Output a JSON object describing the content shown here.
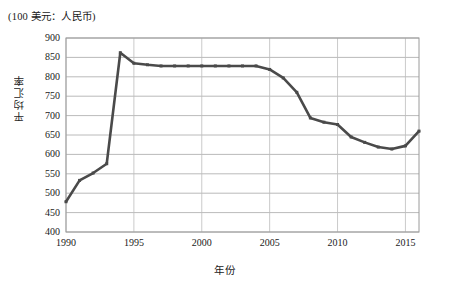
{
  "figure": {
    "unit_note": "(100 美元：人民币)",
    "xlabel": "年份",
    "ylabel": "平均汇率"
  },
  "axis": {
    "y_ticks": [
      "900",
      "850",
      "800",
      "750",
      "700",
      "650",
      "600",
      "550",
      "500",
      "450",
      "400"
    ],
    "x_ticks": [
      "1990",
      "1995",
      "2000",
      "2005",
      "2010",
      "2015"
    ]
  },
  "chart_data": {
    "type": "line",
    "title": "(100 美元：人民币)",
    "xlabel": "年份",
    "ylabel": "平均汇率",
    "xlim": [
      1990,
      2016
    ],
    "ylim": [
      400,
      900
    ],
    "ytick_step": 50,
    "xtick_step": 5,
    "grid": true,
    "legend": "none",
    "line_color": "#4a4a4a",
    "x": [
      1990,
      1991,
      1992,
      1993,
      1994,
      1995,
      1996,
      1997,
      1998,
      1999,
      2000,
      2001,
      2002,
      2003,
      2004,
      2005,
      2006,
      2007,
      2008,
      2009,
      2010,
      2011,
      2012,
      2013,
      2014,
      2015,
      2016
    ],
    "values": [
      478,
      533,
      552,
      576,
      862,
      835,
      831,
      828,
      828,
      828,
      828,
      828,
      828,
      828,
      828,
      819,
      797,
      760,
      694,
      683,
      677,
      645,
      631,
      619,
      614,
      622,
      660
    ],
    "series": [
      {
        "name": "平均汇率",
        "values": [
          478,
          533,
          552,
          576,
          862,
          835,
          831,
          828,
          828,
          828,
          828,
          828,
          828,
          828,
          828,
          819,
          797,
          760,
          694,
          683,
          677,
          645,
          631,
          619,
          614,
          622,
          660
        ]
      }
    ]
  }
}
